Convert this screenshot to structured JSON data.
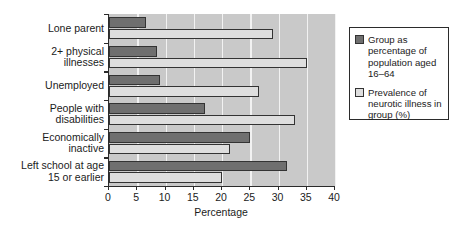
{
  "chart_data": {
    "type": "bar",
    "orientation": "horizontal",
    "title": "",
    "xlabel": "Percentage",
    "ylabel": "",
    "xlim": [
      0,
      40
    ],
    "xticks": [
      0,
      5,
      10,
      15,
      20,
      25,
      30,
      35,
      40
    ],
    "grid": "vertical",
    "legend_position": "right-outside",
    "categories": [
      "Lone parent",
      "2+ physical\nillnesses",
      "Unemployed",
      "People with\ndisabilities",
      "Economically\ninactive",
      "Left school at age\n15 or earlier"
    ],
    "series": [
      {
        "name": "Group as percentage of population aged 16–64",
        "color": "#6f6f6f",
        "values": [
          6.5,
          8.5,
          9,
          17,
          25,
          31.5
        ]
      },
      {
        "name": "Prevalence of neurotic illness in group (%)",
        "color": "#dedede",
        "values": [
          29,
          35,
          26.5,
          33,
          21.5,
          20
        ]
      }
    ],
    "colors": {
      "series_dark": "#6f6f6f",
      "series_light": "#dedede",
      "plot_background": "#c9c9c9",
      "gridline": "#f2f2f2",
      "axis": "#2b2b2b"
    }
  },
  "axis": {
    "x_title": "Percentage",
    "tick_labels": [
      "0",
      "5",
      "10",
      "15",
      "20",
      "25",
      "30",
      "35",
      "40"
    ]
  },
  "legend": {
    "entries": [
      {
        "label": "Group as percentage of population aged 16–64",
        "swatch": "dark-gray-swatch"
      },
      {
        "label": "Prevalence of neurotic illness in group (%)",
        "swatch": "light-gray-swatch"
      }
    ]
  }
}
